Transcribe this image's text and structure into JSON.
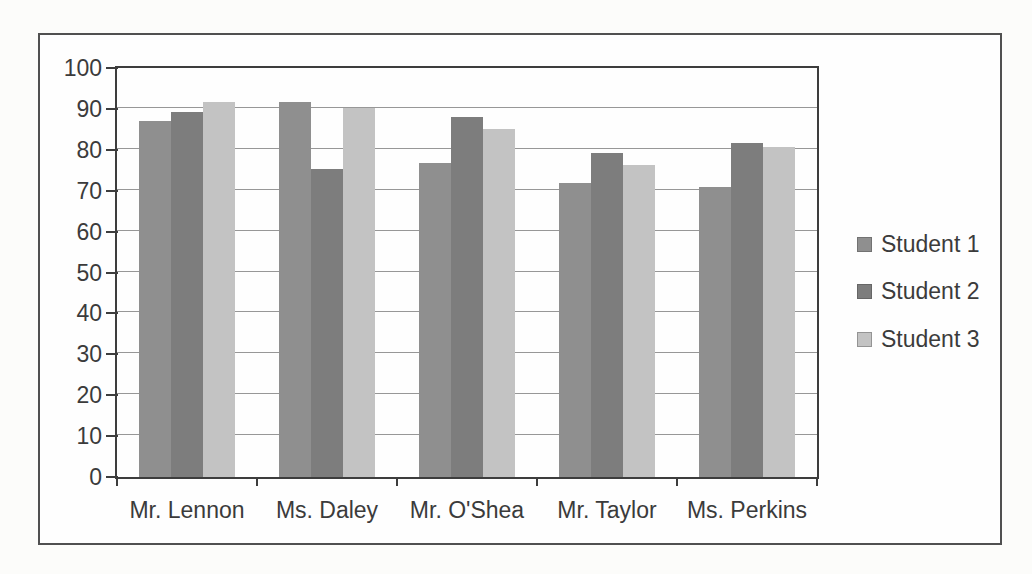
{
  "chart_data": {
    "type": "bar",
    "title": "",
    "xlabel": "",
    "ylabel": "",
    "categories": [
      "Mr. Lennon",
      "Ms. Daley",
      "Mr. O'Shea",
      "Mr. Taylor",
      "Ms. Perkins"
    ],
    "series": [
      {
        "name": "Student 1",
        "color": "#8f8f8f",
        "values": [
          88,
          92.5,
          77.5,
          72.5,
          71.5
        ]
      },
      {
        "name": "Student 2",
        "color": "#7d7d7d",
        "values": [
          90,
          76,
          89,
          80,
          82.5
        ]
      },
      {
        "name": "Student 3",
        "color": "#c3c3c3",
        "values": [
          92.5,
          91,
          86,
          77,
          81.5
        ]
      }
    ],
    "ylim": [
      0,
      100
    ],
    "yticks": [
      0,
      10,
      20,
      30,
      40,
      50,
      60,
      70,
      80,
      90,
      100
    ],
    "grid": "horizontal-major",
    "legend_position": "right",
    "axis_color": "#3d3d3d",
    "gridline_color": "#979797",
    "text_color": "#3b3b3b"
  }
}
